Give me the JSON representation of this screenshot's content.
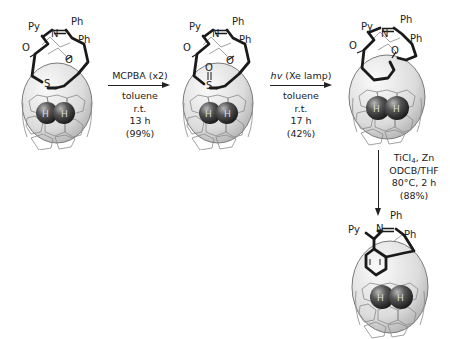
{
  "scheme": {
    "molecules": [
      {
        "id": "open-cage-sulfide",
        "labels": {
          "py": "Py",
          "n": "N",
          "ph1": "Ph",
          "ph2": "Ph",
          "o1": "O",
          "o2": "O",
          "s": "S",
          "h1": "H",
          "h2": "H"
        }
      },
      {
        "id": "open-cage-sulfoxide",
        "labels": {
          "py": "Py",
          "n": "N",
          "ph1": "Ph",
          "ph2": "Ph",
          "o1": "O",
          "o2": "O",
          "o3": "O",
          "s": "S",
          "h1": "H",
          "h2": "H"
        }
      },
      {
        "id": "open-cage-diketone",
        "labels": {
          "py": "Py",
          "n": "N",
          "ph1": "Ph",
          "ph2": "Ph",
          "o1": "O",
          "o2": "O",
          "h1": "H",
          "h2": "H"
        }
      },
      {
        "id": "closed-cage-product",
        "labels": {
          "py": "Py",
          "n": "N",
          "ph1": "Ph",
          "ph2": "Ph",
          "h1": "H",
          "h2": "H"
        }
      }
    ],
    "steps": [
      {
        "reagent": "MCPBA (x2)",
        "solvent": "toluene",
        "temp": "r.t.",
        "time": "13 h",
        "yield": "(99%)"
      },
      {
        "reagent_prefix": "hv",
        "reagent": " (Xe lamp)",
        "solvent": "toluene",
        "temp": "r.t.",
        "time": "17 h",
        "yield": "(42%)"
      },
      {
        "reagent_a": "TiCl",
        "reagent_sub": "4",
        "reagent_b": ", Zn",
        "solvent": "ODCB/THF",
        "conditions": "80°C, 2 h",
        "yield": "(88%)"
      }
    ]
  },
  "colors": {
    "bond": "#1a1a1a",
    "cage_fill": "#e4e4e4",
    "cage_line": "#8a8a8a",
    "h2_sphere": "#4a4a4a"
  }
}
